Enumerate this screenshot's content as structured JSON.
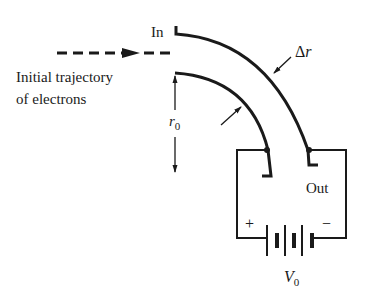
{
  "diagram": {
    "labels": {
      "in": "In",
      "out": "Out",
      "delta_r": "Δr",
      "delta_r_symbol": "Δ",
      "delta_r_var": "r",
      "r0_var": "r",
      "r0_sub": "0",
      "v0_var": "V",
      "v0_sub": "0",
      "trajectory_line1": "Initial trajectory",
      "trajectory_line2": "of electrons",
      "plus": "+",
      "minus": "−"
    },
    "components": [
      {
        "name": "outer-plate",
        "type": "curved electrode"
      },
      {
        "name": "inner-plate",
        "type": "curved electrode"
      },
      {
        "name": "battery",
        "type": "voltage source",
        "label": "V0"
      },
      {
        "name": "electron-beam",
        "type": "dashed arrow"
      }
    ],
    "colors": {
      "ink": "#1a1a1a",
      "background": "#ffffff"
    }
  }
}
